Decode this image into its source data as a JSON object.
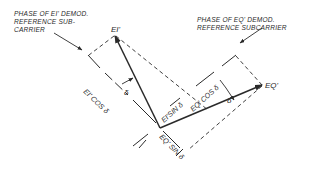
{
  "diagram": {
    "type": "vector phasor diagram",
    "notes": {
      "i_reference": [
        "PHASE OF EI' DEMOD.",
        "REFERENCE SUB-",
        "CARRIER"
      ],
      "q_reference": [
        "PHASE OF EQ' DEMOD.",
        "REFERENCE SUBCARRIER"
      ]
    },
    "vectors": {
      "ei": "EI'",
      "eq": "EQ'"
    },
    "components": {
      "ei_cos": "EI' COS δ",
      "ei_sin": "EI'SIN δ",
      "eq_cos": "EQ' COS δ",
      "eq_sin": "EQ' SIN δ"
    },
    "angles": {
      "delta_left": "δ",
      "delta_right": "δ"
    },
    "colors": {
      "ink": "#2a2a2a",
      "background": "#ffffff"
    }
  }
}
